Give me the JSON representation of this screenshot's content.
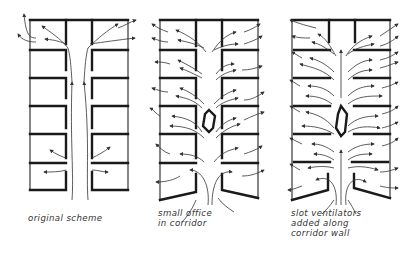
{
  "figure": {
    "panels": [
      {
        "id": "original",
        "caption_lines": [
          "original scheme"
        ]
      },
      {
        "id": "small-office",
        "caption_lines": [
          "small office",
          "in corridor"
        ]
      },
      {
        "id": "slot-ventilators",
        "caption_lines": [
          "slot ventilators",
          "added along",
          "corridor wall"
        ]
      }
    ],
    "colors": {
      "ink": "#1a1a1a",
      "background": "#ffffff"
    }
  }
}
